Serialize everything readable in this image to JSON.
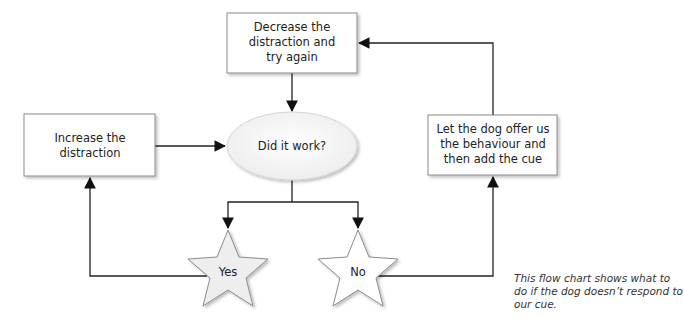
{
  "diagram": {
    "type": "flowchart",
    "nodes": {
      "decrease": {
        "lines": [
          "Decrease the",
          "distraction and",
          "try again"
        ],
        "shape": "rectangle"
      },
      "increase": {
        "lines": [
          "Increase the",
          "distraction"
        ],
        "shape": "rectangle"
      },
      "decision": {
        "lines": [
          "Did it work?"
        ],
        "shape": "ellipse"
      },
      "offer": {
        "lines": [
          "Let the dog offer us",
          "the behaviour and",
          "then add the cue"
        ],
        "shape": "rectangle"
      },
      "yes": {
        "lines": [
          "Yes"
        ],
        "shape": "star"
      },
      "no": {
        "lines": [
          "No"
        ],
        "shape": "star"
      }
    },
    "edges": [
      {
        "from": "decrease",
        "to": "decision"
      },
      {
        "from": "increase",
        "to": "decision"
      },
      {
        "from": "decision",
        "to": "yes"
      },
      {
        "from": "decision",
        "to": "no"
      },
      {
        "from": "yes",
        "to": "increase"
      },
      {
        "from": "no",
        "to": "offer"
      },
      {
        "from": "offer",
        "to": "decrease"
      }
    ]
  },
  "caption": "This flow chart shows what to do if the dog doesn’t respond to our cue.",
  "colors": {
    "stroke": "#222222",
    "box_border": "#8a8a8a",
    "fill_box": "#ffffff",
    "fill_ellipse": "#f2f2f2",
    "fill_star": "#eeeeee"
  }
}
